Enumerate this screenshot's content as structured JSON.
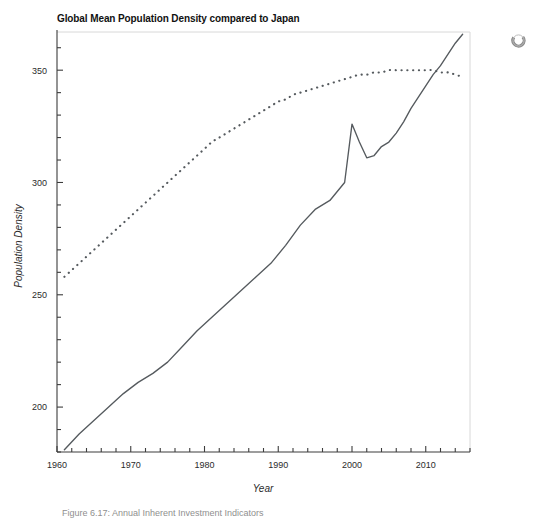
{
  "chart_data": {
    "type": "line",
    "title": "Global Mean Population Density compared to Japan",
    "xlabel": "Year",
    "ylabel": "Population Density",
    "xlim": [
      1960,
      2016
    ],
    "ylim": [
      180,
      367
    ],
    "grid": false,
    "legend_position": "none",
    "x_tick_labels": [
      "1960",
      "1970",
      "1980",
      "1990",
      "2000",
      "2010"
    ],
    "x_ticks": [
      1960,
      1970,
      1980,
      1990,
      2000,
      2010
    ],
    "x_minor_tick_interval": 2,
    "y_tick_labels": [
      "200",
      "250",
      "300",
      "350"
    ],
    "y_ticks": [
      200,
      250,
      300,
      350
    ],
    "y_minor_tick_interval": 10,
    "series": [
      {
        "name": "Japan",
        "style": "solid",
        "color": "#555a5e",
        "x": [
          1961,
          1963,
          1965,
          1967,
          1969,
          1971,
          1973,
          1975,
          1977,
          1979,
          1981,
          1983,
          1985,
          1987,
          1989,
          1991,
          1993,
          1995,
          1997,
          1999,
          2000,
          2001,
          2002,
          2003,
          2004,
          2005,
          2006,
          2007,
          2008,
          2009,
          2010,
          2011,
          2012,
          2013,
          2014,
          2015
        ],
        "values": [
          181,
          188,
          194,
          200,
          206,
          211,
          215,
          220,
          227,
          234,
          240,
          246,
          252,
          258,
          264,
          272,
          281,
          288,
          292,
          300,
          326,
          318,
          311,
          312,
          316,
          318,
          322,
          327,
          333,
          338,
          343,
          348,
          352,
          357,
          362,
          366
        ]
      },
      {
        "name": "Global Mean",
        "style": "dotted",
        "color": "#555a5e",
        "x": [
          1961,
          1962,
          1963,
          1964,
          1965,
          1966,
          1967,
          1968,
          1969,
          1970,
          1971,
          1972,
          1973,
          1974,
          1975,
          1976,
          1977,
          1978,
          1979,
          1980,
          1981,
          1982,
          1983,
          1984,
          1985,
          1986,
          1987,
          1988,
          1989,
          1990,
          1991,
          1992,
          1993,
          1994,
          1995,
          1996,
          1997,
          1998,
          1999,
          2000,
          2001,
          2002,
          2003,
          2004,
          2005,
          2006,
          2007,
          2008,
          2009,
          2010,
          2011,
          2012,
          2013,
          2014,
          2015
        ],
        "values": [
          258,
          261,
          264,
          267,
          270,
          273,
          276,
          279,
          282,
          285,
          288,
          291,
          294,
          297,
          300,
          303,
          306,
          309,
          312,
          315,
          318,
          320,
          322,
          324,
          326,
          328,
          330,
          332,
          334,
          336,
          337,
          339,
          340,
          341,
          342,
          343,
          344,
          345,
          346,
          347,
          348,
          348,
          349,
          349,
          350,
          350,
          350,
          350,
          350,
          350,
          350,
          349,
          349,
          348,
          347
        ]
      }
    ]
  },
  "figure": {
    "caption": "Figure 6.17: Annual Inherent Investment Indicators"
  },
  "overlay": {
    "spinner_label": "loading-spinner"
  }
}
